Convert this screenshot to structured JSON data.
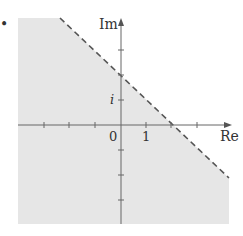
{
  "figure": {
    "bullet": "•",
    "axes": {
      "x_label": "Re",
      "y_label": "Im",
      "origin_label": "0",
      "x_tick_label": "1",
      "y_tick_label": "i"
    },
    "boundary": {
      "style": "dashed",
      "x_intercept": 2,
      "y_intercept": 2
    },
    "colors": {
      "shade": "#e6e6e6",
      "axis": "#555555",
      "boundary": "#555555"
    }
  }
}
